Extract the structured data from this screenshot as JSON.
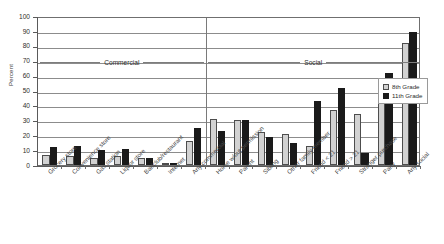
{
  "chart_data": {
    "type": "bar",
    "title": "",
    "xlabel": "",
    "ylabel": "Percent",
    "ylim": [
      0,
      100
    ],
    "ytick_step": 10,
    "yticks": [
      100,
      90,
      80,
      70,
      60,
      50,
      40,
      30,
      20,
      10,
      0
    ],
    "grid": true,
    "legend_position": "right",
    "categories": [
      "Grocery store",
      "Convenience store",
      "Gas station",
      "Liquor store",
      "Bar/club/restaurant",
      "Internet",
      "Any commercial",
      "Home w/out permission",
      "Parent",
      "Sibling",
      "Other family member",
      "Friend < 21",
      "Friend > 21",
      "Stranger purchase",
      "Party",
      "Any social"
    ],
    "series": [
      {
        "name": "8th Grade",
        "color": "#d2d2d2",
        "values": [
          7,
          6,
          5,
          6,
          5,
          1,
          16,
          31,
          30,
          22,
          21,
          13,
          37,
          34,
          44,
          82
        ]
      },
      {
        "name": "11th Grade",
        "color": "#1a1a1a",
        "values": [
          12,
          13,
          10,
          11,
          5,
          1,
          25,
          23,
          30,
          19,
          15,
          43,
          52,
          8,
          62,
          89
        ]
      }
    ],
    "group_bands": [
      {
        "label": "Commercial",
        "start_index": 0,
        "end_index": 6
      },
      {
        "label": "Social",
        "start_index": 7,
        "end_index": 15
      }
    ],
    "divider_after_index": 6
  },
  "legend": {
    "items": [
      {
        "label": "8th Grade",
        "swatch": "g8"
      },
      {
        "label": "11th Grade",
        "swatch": "g11"
      }
    ]
  }
}
